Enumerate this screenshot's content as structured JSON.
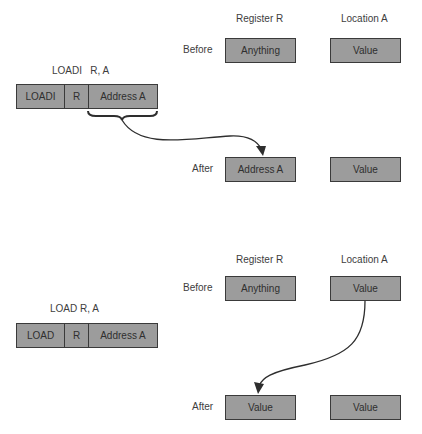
{
  "top": {
    "instruction_label": "LOADI   R, A",
    "instruction_fields": [
      "LOADI",
      "R",
      "Address A"
    ],
    "column_headers": {
      "register": "Register R",
      "location": "Location A"
    },
    "before": {
      "label": "Before",
      "register": "Anything",
      "location": "Value"
    },
    "after": {
      "label": "After",
      "register": "Address A",
      "location": "Value"
    }
  },
  "bottom": {
    "instruction_label": "LOAD R, A",
    "instruction_fields": [
      "LOAD",
      "R",
      "Address A"
    ],
    "column_headers": {
      "register": "Register R",
      "location": "Location A"
    },
    "before": {
      "label": "Before",
      "register": "Anything",
      "location": "Value"
    },
    "after": {
      "label": "After",
      "register": "Value",
      "location": "Value"
    }
  },
  "colors": {
    "box_fill": "#9c9c9c",
    "stroke": "#3a3a3a",
    "text": "#3d3d3d"
  }
}
